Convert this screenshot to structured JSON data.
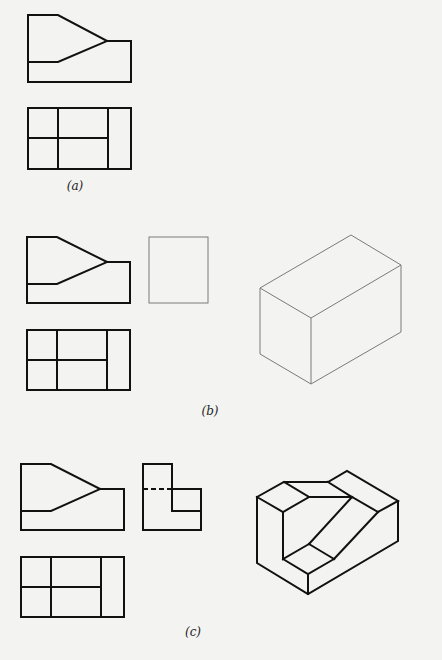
{
  "labels": {
    "a": "(a)",
    "b": "(b)",
    "c": "(c)"
  },
  "figures": {
    "a": {
      "front_view": {
        "outline": "28,15 58,15 107,41 131,41 131,82 28,82 28,15",
        "inner": [
          "28,62 58,62 107,41"
        ]
      },
      "top_view": {
        "rect": [
          28,
          108,
          103,
          61
        ],
        "lines": [
          "58,108 58,169",
          "108,108 108,169",
          "28,138 108,138"
        ]
      },
      "label_pos": [
        75,
        186
      ]
    },
    "b": {
      "front_view": {
        "outline": "27,237 57,237 107,262 130,262 130,303 27,303 27,237",
        "inner": [
          "27,284 57,284 107,262"
        ]
      },
      "side_view": {
        "rect": [
          149,
          237,
          59,
          66
        ]
      },
      "top_view": {
        "rect": [
          27,
          330,
          103,
          60
        ],
        "lines": [
          "57,330 57,390",
          "107,330 107,390",
          "27,360 107,360"
        ]
      },
      "isometric_box": {
        "top_face": "351,235 401,265 311,318 260,288 351,235",
        "edges": [
          "260,288 260,354",
          "311,318 311,384",
          "401,265 401,332",
          "260,354 311,384 401,332"
        ]
      },
      "label_pos": [
        210,
        411
      ]
    },
    "c": {
      "front_view": {
        "outline": "21,464 51,464 100,489 124,489 124,530 21,530 21,464",
        "inner": [
          "21,511 51,511 100,489"
        ]
      },
      "side_view": {
        "outline": "143,464 172,464 172,489 201,489 201,530 143,530 143,464",
        "inner": [
          "172,489 172,511 201,511"
        ],
        "hidden": [
          "143,489 172,489"
        ]
      },
      "top_view": {
        "rect": [
          21,
          557,
          103,
          60
        ],
        "lines": [
          "51,557 51,617",
          "101,557 101,617",
          "21,587 101,587"
        ]
      },
      "isometric_object": {
        "lines": [
          "257,497 284,482 309,497 283,512 257,497",
          "284,482 328,482 347,471 398,501 378,512",
          "309,497 352,497 378,512",
          "328,482 352,497",
          "352,497 309,544",
          "378,512 334,559",
          "309,544 334,559",
          "283,512 283,559 309,544",
          "283,559 308,574 334,559",
          "257,497 257,563 308,594 398,541 398,501",
          "308,574 308,594"
        ]
      },
      "label_pos": [
        193,
        632
      ]
    }
  }
}
